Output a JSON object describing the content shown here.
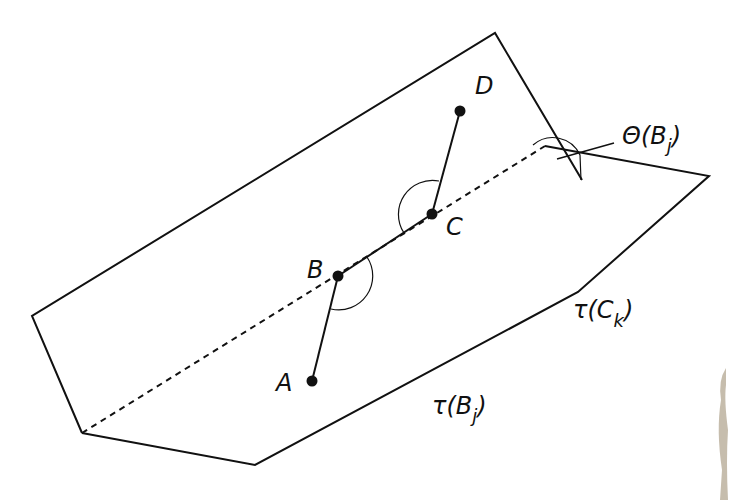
{
  "diagram": {
    "points": [
      {
        "id": "A",
        "label": "A",
        "x": 312,
        "y": 381
      },
      {
        "id": "B",
        "label": "B",
        "x": 338,
        "y": 276
      },
      {
        "id": "C",
        "label": "C",
        "x": 432,
        "y": 214
      },
      {
        "id": "D",
        "label": "D",
        "x": 460,
        "y": 111
      }
    ],
    "labels": {
      "theta": "Θ(B",
      "theta_sub": "j",
      "theta_close": ")",
      "tau_c": "τ(C",
      "tau_c_sub": "k",
      "tau_c_close": ")",
      "tau_b": "τ(B",
      "tau_b_sub": "j",
      "tau_b_close": ")"
    },
    "colors": {
      "stroke": "#111111",
      "background": "#ffffff",
      "smudge": "#b8ad98"
    }
  }
}
